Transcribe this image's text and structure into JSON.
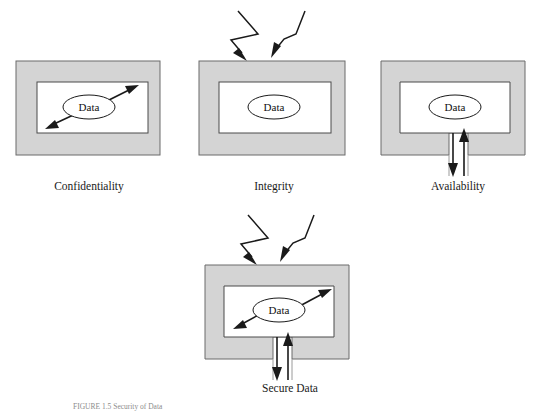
{
  "figure": {
    "caption": "FIGURE 1.5  Security of Data",
    "background_color": "#ffffff",
    "shell_fill": "#d4d4d4",
    "shell_stroke": "#6b6b6b",
    "inner_fill": "#ffffff",
    "inner_stroke": "#4a4a4a",
    "ink_color": "#1a1a1a"
  },
  "panels": [
    {
      "id": "confidentiality",
      "caption": "Confidentiality",
      "data_label": "Data",
      "threat_bolts": 0,
      "leak_arrows": 2,
      "has_channel": false,
      "channel_arrows": 0
    },
    {
      "id": "integrity",
      "caption": "Integrity",
      "data_label": "Data",
      "threat_bolts": 2,
      "leak_arrows": 0,
      "has_channel": false,
      "channel_arrows": 0
    },
    {
      "id": "availability",
      "caption": "Availability",
      "data_label": "Data",
      "threat_bolts": 0,
      "leak_arrows": 0,
      "has_channel": true,
      "channel_arrows": 2
    },
    {
      "id": "secure-data",
      "caption": "Secure Data",
      "data_label": "Data",
      "threat_bolts": 2,
      "leak_arrows": 2,
      "has_channel": true,
      "channel_arrows": 2
    }
  ]
}
